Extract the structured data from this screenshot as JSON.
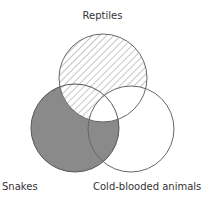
{
  "diagram": {
    "type": "venn",
    "sets": [
      {
        "id": "reptiles",
        "label": "Reptiles",
        "cx": 103,
        "cy": 78,
        "r": 44
      },
      {
        "id": "snakes",
        "label": "Snakes",
        "cx": 75,
        "cy": 128,
        "r": 44
      },
      {
        "id": "cold",
        "label": "Cold-blooded animals",
        "cx": 131,
        "cy": 129,
        "r": 43
      }
    ],
    "regions": {
      "reptiles_only": "hatched",
      "reptiles_snakes_only": "hatched",
      "reptiles_cold_only": "empty",
      "all_three": "empty",
      "snakes_only": "shaded",
      "snakes_cold_only": "shaded",
      "cold_only": "empty"
    },
    "colors": {
      "shaded": "#8a8a8a",
      "hatch": "#a8a8a8",
      "outline": "#666666",
      "background": "#ffffff",
      "text": "#333333"
    }
  },
  "labels": {
    "reptiles": "Reptiles",
    "snakes": "Snakes",
    "cold": "Cold-blooded animals"
  }
}
